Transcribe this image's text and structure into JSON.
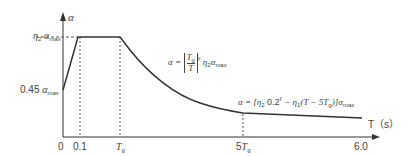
{
  "diagram": {
    "y_axis_label": "α",
    "x_axis_label": "T（s）",
    "y_ticks": {
      "top": {
        "coef": "η",
        "coef_sub": "2",
        "var": "α",
        "var_sub": "max"
      },
      "start": {
        "coef": "0.45",
        "var": "α",
        "var_sub": "max"
      }
    },
    "x_ticks": {
      "t0": "0",
      "t1": "0.1",
      "tg": {
        "var": "T",
        "sub": "g"
      },
      "t5g": {
        "coef": "5",
        "var": "T",
        "sub": "g"
      },
      "t6": "6.0"
    },
    "formula_curve": {
      "lhs": "α =",
      "frac_num": "T",
      "frac_num_sub": "g",
      "frac_den": "T",
      "exp": "γ",
      "rhs": "η",
      "rhs_sub": "2",
      "rhs_var": "α",
      "rhs_var_sub": "max"
    },
    "formula_line": {
      "text_a": "α = [η",
      "sub_a": "2",
      "text_b": " 0.2",
      "sup_b": "γ",
      "text_c": " − η",
      "sub_c": "1",
      "text_d": "(T − 5T",
      "sub_d": "g",
      "text_e": ")]α",
      "sub_e": "max"
    },
    "colors": {
      "line": "#333333",
      "dash": "#555555"
    }
  }
}
